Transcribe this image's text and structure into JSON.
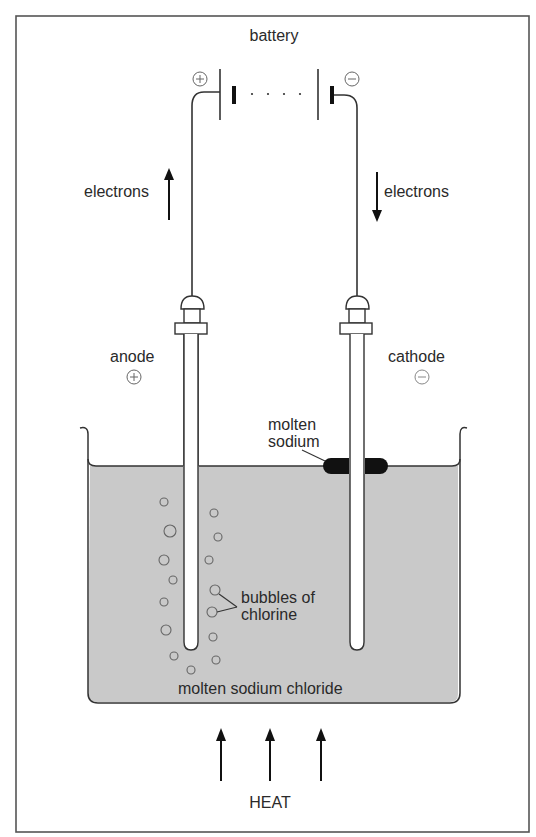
{
  "diagram": {
    "labels": {
      "battery": "battery",
      "battery_positive": "+",
      "battery_negative": "−",
      "electrons_left": "electrons",
      "electrons_right": "electrons",
      "anode": "anode",
      "anode_sign": "+",
      "cathode": "cathode",
      "cathode_sign": "−",
      "molten_sodium_line1": "molten",
      "molten_sodium_line2": "sodium",
      "bubbles_line1": "bubbles of",
      "bubbles_line2": "chlorine",
      "liquid": "molten sodium chloride",
      "heat": "HEAT"
    },
    "arrows": {
      "electrons_left_direction": "up",
      "electrons_right_direction": "down",
      "heat_arrow_count": 3,
      "heat_direction": "up"
    },
    "colors": {
      "liquid_fill": "#c9c9c9",
      "ink": "#2a2a2a",
      "molten_sodium": "#111111",
      "frame": "#555555"
    },
    "bubbles": [
      {
        "cx": 164,
        "cy": 502,
        "r": 4
      },
      {
        "cx": 170,
        "cy": 531,
        "r": 6
      },
      {
        "cx": 164,
        "cy": 560,
        "r": 5
      },
      {
        "cx": 173,
        "cy": 580,
        "r": 4
      },
      {
        "cx": 164,
        "cy": 602,
        "r": 4
      },
      {
        "cx": 166,
        "cy": 630,
        "r": 5
      },
      {
        "cx": 174,
        "cy": 656,
        "r": 4
      },
      {
        "cx": 191,
        "cy": 670,
        "r": 4
      },
      {
        "cx": 214,
        "cy": 513,
        "r": 4
      },
      {
        "cx": 218,
        "cy": 537,
        "r": 4
      },
      {
        "cx": 209,
        "cy": 560,
        "r": 4
      },
      {
        "cx": 215,
        "cy": 590,
        "r": 5
      },
      {
        "cx": 212,
        "cy": 612,
        "r": 5
      },
      {
        "cx": 213,
        "cy": 637,
        "r": 4
      },
      {
        "cx": 216,
        "cy": 660,
        "r": 4
      }
    ]
  }
}
